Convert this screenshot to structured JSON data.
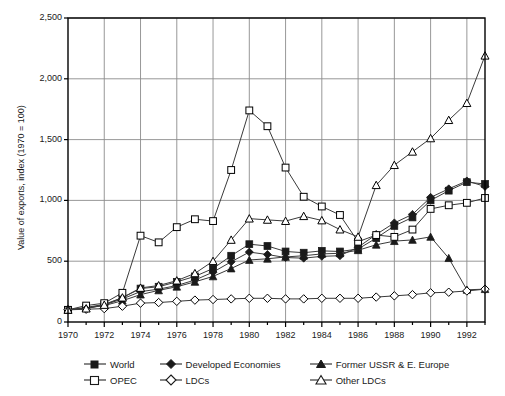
{
  "chart_data": {
    "type": "line",
    "title": "",
    "xlabel": "",
    "ylabel": "Value of exports, index (1970 = 100)",
    "xlim": [
      1970,
      1993
    ],
    "ylim": [
      0,
      2500
    ],
    "grid": true,
    "legend_position": "bottom",
    "x": [
      1970,
      1971,
      1972,
      1973,
      1974,
      1975,
      1976,
      1977,
      1978,
      1979,
      1980,
      1981,
      1982,
      1983,
      1984,
      1985,
      1986,
      1987,
      1988,
      1989,
      1990,
      1991,
      1992,
      1993
    ],
    "y_ticks": [
      0,
      500,
      1000,
      1500,
      2000,
      2500
    ],
    "y_tick_labels": [
      "0",
      "500",
      "1,000",
      "1,500",
      "2,000",
      "2,500"
    ],
    "x_ticks": [
      1970,
      1972,
      1974,
      1976,
      1978,
      1980,
      1982,
      1984,
      1986,
      1988,
      1990,
      1992
    ],
    "x_tick_labels": [
      "1970",
      "1972",
      "1974",
      "1976",
      "1978",
      "1980",
      "1982",
      "1984",
      "1986",
      "1988",
      "1990",
      "1992"
    ],
    "series": [
      {
        "name": "World",
        "marker": "filled-square",
        "color": "#000000",
        "values": [
          100,
          120,
          145,
          200,
          275,
          290,
          330,
          375,
          440,
          545,
          640,
          625,
          580,
          570,
          585,
          580,
          600,
          690,
          790,
          860,
          1000,
          1080,
          1150,
          1135
        ]
      },
      {
        "name": "Developed Economies",
        "marker": "filled-diamond",
        "color": "#000000",
        "values": [
          100,
          115,
          140,
          190,
          250,
          270,
          300,
          345,
          410,
          495,
          575,
          555,
          530,
          525,
          540,
          545,
          615,
          720,
          815,
          885,
          1025,
          1095,
          1160,
          1115
        ]
      },
      {
        "name": "Former USSR & E. Europe",
        "marker": "filled-triangle",
        "color": "#000000",
        "values": [
          100,
          115,
          135,
          175,
          225,
          260,
          290,
          330,
          375,
          440,
          510,
          520,
          535,
          545,
          560,
          565,
          590,
          635,
          665,
          675,
          700,
          525,
          265,
          270
        ]
      },
      {
        "name": "OPEC",
        "marker": "open-square",
        "color": "#000000",
        "values": [
          100,
          135,
          155,
          240,
          710,
          655,
          780,
          845,
          830,
          1250,
          1740,
          1610,
          1270,
          1030,
          950,
          880,
          660,
          715,
          700,
          760,
          930,
          960,
          980,
          1020
        ]
      },
      {
        "name": "LDCs",
        "marker": "open-diamond",
        "color": "#000000",
        "values": [
          100,
          105,
          110,
          130,
          155,
          160,
          170,
          180,
          185,
          190,
          195,
          195,
          190,
          190,
          195,
          195,
          195,
          205,
          215,
          225,
          240,
          245,
          255,
          270
        ]
      },
      {
        "name": "Other LDCs",
        "marker": "open-triangle",
        "color": "#000000",
        "values": [
          100,
          110,
          140,
          200,
          280,
          300,
          340,
          400,
          500,
          675,
          850,
          840,
          830,
          870,
          835,
          760,
          700,
          1125,
          1290,
          1400,
          1510,
          1660,
          1800,
          2190
        ]
      }
    ]
  },
  "legend": {
    "items": [
      {
        "label": "World",
        "marker": "filled-square"
      },
      {
        "label": "Developed Economies",
        "marker": "filled-diamond"
      },
      {
        "label": "Former USSR & E. Europe",
        "marker": "filled-triangle"
      },
      {
        "label": "OPEC",
        "marker": "open-square"
      },
      {
        "label": "LDCs",
        "marker": "open-diamond"
      },
      {
        "label": "Other LDCs",
        "marker": "open-triangle"
      }
    ]
  },
  "style": {
    "line_color": "#3a3a3a",
    "grid_color": "#8c8c8c",
    "frame_color": "#000000",
    "marker_fill_solid": "#1a1a1a",
    "marker_fill_open": "#ffffff",
    "background": "#ffffff"
  }
}
